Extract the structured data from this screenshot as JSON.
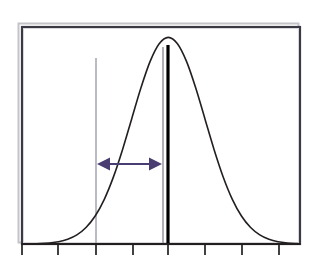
{
  "figure": {
    "title": "",
    "background_color": "#ffffff",
    "width": 324,
    "height": 267
  },
  "colors": {
    "curve": "#231f20",
    "axis": "#231f20",
    "frame": "#3a3a44",
    "frame_shadow": "#b9b9bd",
    "arrow": "#4a3d72",
    "reference_line_thin": "#8e8e9c",
    "mean_line_thick": "#000000",
    "background": "#ffffff"
  },
  "plot_area": {
    "left": 22,
    "right": 300,
    "top": 27,
    "bottom": 244
  },
  "axis": {
    "name": "x-axis",
    "baseline_y": 244,
    "tick_length": 11,
    "tick_positions": [
      22,
      58,
      96,
      133,
      168,
      205,
      242,
      279
    ],
    "tick_labels": [
      "",
      "",
      "",
      "",
      "",
      "",
      "",
      ""
    ],
    "tick_count": 8,
    "tick_spacing": 37
  },
  "chart_data": {
    "type": "line",
    "title": "",
    "subtitle": "",
    "xlabel": "",
    "ylabel": "",
    "grid": false,
    "legend": null,
    "legend_position": "none",
    "xlim": [
      -4.0,
      3.6
    ],
    "ylim": [
      0,
      1.05
    ],
    "series": [
      {
        "name": "Normal probability density curve",
        "kind": "bell-curve",
        "mean": 0.0,
        "std_dev": 1.0,
        "peak_value": 1.0,
        "stroke": "#231f20",
        "stroke_width": 1.6,
        "x": [
          -4.0,
          -3.75,
          -3.5,
          -3.25,
          -3.0,
          -2.75,
          -2.5,
          -2.25,
          -2.0,
          -1.75,
          -1.5,
          -1.25,
          -1.0,
          -0.75,
          -0.5,
          -0.25,
          0.0,
          0.25,
          0.5,
          0.75,
          1.0,
          1.25,
          1.5,
          1.75,
          2.0,
          2.25,
          2.5,
          2.75,
          3.0,
          3.25,
          3.5,
          3.6
        ],
        "y": [
          0.0003,
          0.0009,
          0.0022,
          0.0052,
          0.0111,
          0.0228,
          0.0439,
          0.0796,
          0.1353,
          0.2163,
          0.3247,
          0.4578,
          0.6065,
          0.7548,
          0.8825,
          0.9692,
          1.0,
          0.9692,
          0.8825,
          0.7548,
          0.6065,
          0.4578,
          0.3247,
          0.2163,
          0.1353,
          0.0796,
          0.0439,
          0.0228,
          0.0111,
          0.0052,
          0.0022,
          0.0015
        ]
      }
    ],
    "annotations": [
      {
        "name": "lower-reference-line",
        "type": "vline",
        "x_px": 96,
        "y_top_px": 58,
        "y_bottom_px": 244,
        "color": "#8e8e9c",
        "width": 1.2,
        "label": ""
      },
      {
        "name": "upper-reference-line",
        "type": "vline",
        "x_px": 163,
        "y_top_px": 47,
        "y_bottom_px": 244,
        "color": "#8e8e9c",
        "width": 1.4,
        "label": ""
      },
      {
        "name": "mean-line",
        "type": "vline",
        "x_px": 168,
        "y_top_px": 45,
        "y_bottom_px": 244,
        "color": "#000000",
        "width": 3.2,
        "label": ""
      },
      {
        "name": "interval-double-arrow",
        "type": "double-arrow",
        "x_start_px": 97,
        "x_end_px": 162,
        "y_px": 164,
        "color": "#4a3d72",
        "line_width": 2,
        "head_length": 13,
        "head_width": 13,
        "label": ""
      }
    ]
  }
}
